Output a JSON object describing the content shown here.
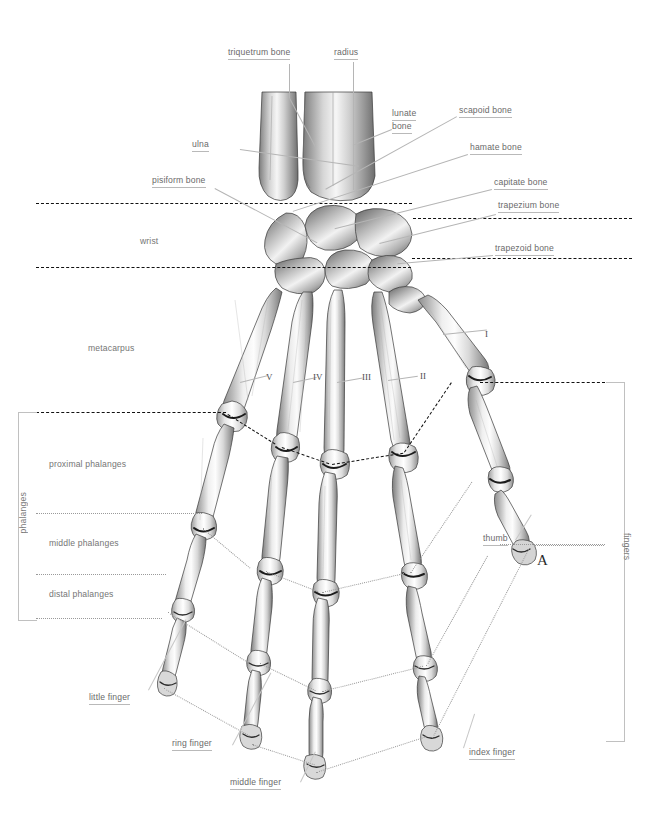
{
  "figure": {
    "mark": "A",
    "background_color": "#ffffff",
    "label_color": "#6a6a6a",
    "bone_color": "#cfcfcf"
  },
  "labels": {
    "triquetrum": "triquetrum bone",
    "radius": "radius",
    "lunate_line1": "lunate",
    "lunate_line2": "bone",
    "scapoid": "scapoid bone",
    "hamate": "hamate bone",
    "capitate": "capitate bone",
    "trapezium": "trapezium bone",
    "trapezoid": "trapezoid bone",
    "ulna": "ulna",
    "pisiform": "pisiform bone",
    "wrist": "wrist",
    "metacarpus": "metacarpus",
    "proximal": "proximal phalanges",
    "middle": "middle phalanges",
    "distal": "distal phalanges",
    "phalanges": "phalanges",
    "fingers": "fingers",
    "thumb": "thumb",
    "little_finger": "little finger",
    "ring_finger": "ring finger",
    "middle_finger": "middle finger",
    "index_finger": "index finger"
  },
  "metacarpal_numerals": {
    "one": "I",
    "two": "II",
    "three": "III",
    "four": "IV",
    "five": "V"
  }
}
